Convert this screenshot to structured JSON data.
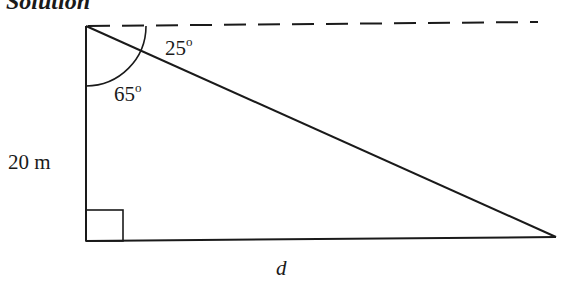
{
  "heading": "Solution",
  "labels": {
    "angle_top": "25",
    "angle_inner": "65",
    "degree_symbol": "o",
    "height": "20 m",
    "base": "d"
  },
  "colors": {
    "stroke": "#1a1a1a",
    "background": "#ffffff"
  }
}
